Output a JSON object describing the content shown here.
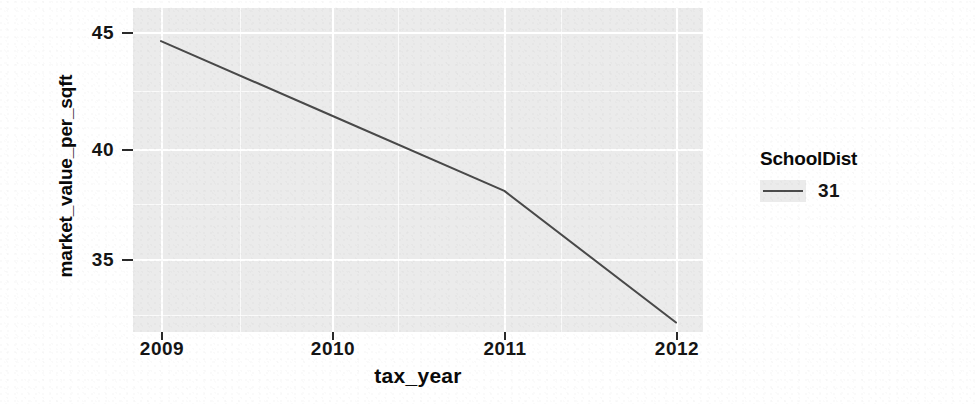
{
  "chart_data": {
    "type": "line",
    "title": "",
    "xlabel": "tax_year",
    "ylabel": "market_value_per_sqft",
    "x": [
      2009,
      2010,
      2011,
      2012
    ],
    "xlim": [
      2009,
      2012
    ],
    "ylim": [
      32.0,
      45.3
    ],
    "grid": true,
    "legend_position": "right",
    "legend_title": "SchoolDist",
    "xticks": [
      "2009",
      "2010",
      "2011",
      "2012"
    ],
    "yticks": [
      "35",
      "40",
      "45"
    ],
    "ytick_values": [
      35,
      40,
      45
    ],
    "series": [
      {
        "name": "31",
        "color": "#3b3b3b",
        "values": [
          44.6,
          41.3,
          38.0,
          32.2
        ]
      }
    ]
  },
  "axes": {
    "y_title": "market_value_per_sqft",
    "x_title": "tax_year",
    "y_ticks": [
      {
        "label": "45",
        "value": 45
      },
      {
        "label": "40",
        "value": 40
      },
      {
        "label": "35",
        "value": 35
      }
    ],
    "x_ticks": [
      {
        "label": "2009",
        "value": 2009
      },
      {
        "label": "2010",
        "value": 2010
      },
      {
        "label": "2011",
        "value": 2011
      },
      {
        "label": "2012",
        "value": 2012
      }
    ]
  },
  "legend": {
    "title": "SchoolDist",
    "entries": [
      {
        "label": "31",
        "color": "#3b3b3b"
      }
    ]
  },
  "theme": {
    "panel_background": "#ebebeb",
    "gridline_color": "#ffffff",
    "line_color": "#3b3b3b",
    "text_color": "#151515",
    "page_background": "#ffffff"
  }
}
